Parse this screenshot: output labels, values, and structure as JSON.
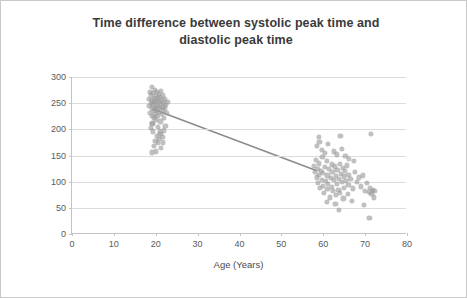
{
  "chart_data": {
    "type": "scatter",
    "title": "Time difference between systolic peak time and diastolic peak time",
    "title_line1": "Time difference between systolic peak time and",
    "title_line2": "diastolic peak time",
    "xlabel": "Age (Years)",
    "ylabel": "DpTime - SpTime (ms)",
    "xlim": [
      0,
      80
    ],
    "ylim": [
      0,
      300
    ],
    "xticks": [
      0,
      10,
      20,
      30,
      40,
      50,
      60,
      70,
      80
    ],
    "yticks": [
      0,
      50,
      100,
      150,
      200,
      250,
      300
    ],
    "grid": "horizontal",
    "legend": "none",
    "marker_color": "#9a9a9a",
    "trendline_color": "#8c8c8c",
    "trendline": {
      "x1": 19.5,
      "y1": 238,
      "x2": 58.5,
      "y2": 120
    },
    "points": [
      [
        18.3,
        258
      ],
      [
        18.5,
        244
      ],
      [
        18.6,
        272
      ],
      [
        18.7,
        232
      ],
      [
        18.8,
        251
      ],
      [
        18.9,
        266
      ],
      [
        19.0,
        240
      ],
      [
        19.0,
        225
      ],
      [
        19.1,
        281
      ],
      [
        19.2,
        257
      ],
      [
        19.2,
        212
      ],
      [
        19.3,
        248
      ],
      [
        19.4,
        270
      ],
      [
        19.5,
        236
      ],
      [
        19.5,
        260
      ],
      [
        19.6,
        222
      ],
      [
        19.7,
        253
      ],
      [
        19.8,
        276
      ],
      [
        19.8,
        241
      ],
      [
        19.9,
        230
      ],
      [
        20.0,
        264
      ],
      [
        20.0,
        247
      ],
      [
        20.1,
        219
      ],
      [
        20.2,
        255
      ],
      [
        20.3,
        271
      ],
      [
        20.3,
        238
      ],
      [
        20.4,
        226
      ],
      [
        20.5,
        259
      ],
      [
        20.6,
        245
      ],
      [
        20.6,
        205
      ],
      [
        20.7,
        268
      ],
      [
        20.8,
        233
      ],
      [
        20.9,
        252
      ],
      [
        21.0,
        262
      ],
      [
        21.0,
        241
      ],
      [
        21.1,
        215
      ],
      [
        21.2,
        249
      ],
      [
        21.3,
        274
      ],
      [
        21.4,
        229
      ],
      [
        21.5,
        256
      ],
      [
        21.6,
        243
      ],
      [
        21.7,
        265
      ],
      [
        21.8,
        236
      ],
      [
        21.9,
        250
      ],
      [
        22.0,
        222
      ],
      [
        22.1,
        258
      ],
      [
        22.2,
        240
      ],
      [
        22.4,
        246
      ],
      [
        22.6,
        231
      ],
      [
        22.8,
        253
      ],
      [
        19.4,
        196
      ],
      [
        20.2,
        188
      ],
      [
        21.1,
        192
      ],
      [
        20.7,
        182
      ],
      [
        19.9,
        178
      ],
      [
        21.6,
        186
      ],
      [
        20.5,
        174
      ],
      [
        19.6,
        168
      ],
      [
        21.3,
        164
      ],
      [
        20.9,
        196
      ],
      [
        18.9,
        203
      ],
      [
        22.0,
        198
      ],
      [
        19.2,
        210
      ],
      [
        22.3,
        207
      ],
      [
        20.1,
        158
      ],
      [
        21.8,
        175
      ],
      [
        19.1,
        156
      ],
      [
        57.8,
        130
      ],
      [
        58.0,
        118
      ],
      [
        58.2,
        142
      ],
      [
        58.4,
        108
      ],
      [
        58.6,
        125
      ],
      [
        58.8,
        97
      ],
      [
        59.0,
        135
      ],
      [
        59.0,
        113
      ],
      [
        59.2,
        88
      ],
      [
        59.4,
        121
      ],
      [
        59.6,
        104
      ],
      [
        59.8,
        147
      ],
      [
        60.0,
        92
      ],
      [
        60.0,
        116
      ],
      [
        60.2,
        78
      ],
      [
        60.4,
        128
      ],
      [
        60.6,
        101
      ],
      [
        60.8,
        139
      ],
      [
        61.0,
        86
      ],
      [
        61.0,
        112
      ],
      [
        61.2,
        95
      ],
      [
        61.4,
        124
      ],
      [
        61.6,
        70
      ],
      [
        61.8,
        107
      ],
      [
        62.0,
        133
      ],
      [
        62.0,
        90
      ],
      [
        62.2,
        119
      ],
      [
        62.4,
        82
      ],
      [
        62.6,
        103
      ],
      [
        62.8,
        129
      ],
      [
        63.0,
        74
      ],
      [
        63.0,
        111
      ],
      [
        63.2,
        96
      ],
      [
        63.4,
        122
      ],
      [
        63.6,
        85
      ],
      [
        63.8,
        106
      ],
      [
        64.0,
        134
      ],
      [
        64.0,
        79
      ],
      [
        64.2,
        115
      ],
      [
        64.4,
        99
      ],
      [
        64.6,
        126
      ],
      [
        64.8,
        68
      ],
      [
        65.0,
        110
      ],
      [
        65.0,
        88
      ],
      [
        65.2,
        120
      ],
      [
        65.4,
        102
      ],
      [
        65.6,
        131
      ],
      [
        65.8,
        76
      ],
      [
        66.0,
        113
      ],
      [
        66.0,
        94
      ],
      [
        66.5,
        105
      ],
      [
        67.0,
        87
      ],
      [
        67.5,
        118
      ],
      [
        68.0,
        99
      ],
      [
        68.5,
        108
      ],
      [
        69.0,
        91
      ],
      [
        69.5,
        112
      ],
      [
        70.0,
        83
      ],
      [
        70.5,
        97
      ],
      [
        71.0,
        80
      ],
      [
        71.2,
        88
      ],
      [
        71.5,
        76
      ],
      [
        71.8,
        85
      ],
      [
        72.0,
        70
      ],
      [
        72.2,
        82
      ],
      [
        58.5,
        168
      ],
      [
        59.1,
        176
      ],
      [
        59.7,
        160
      ],
      [
        60.3,
        155
      ],
      [
        61.1,
        172
      ],
      [
        62.5,
        158
      ],
      [
        63.3,
        152
      ],
      [
        64.1,
        187
      ],
      [
        64.5,
        162
      ],
      [
        65.3,
        149
      ],
      [
        66.2,
        144
      ],
      [
        67.3,
        140
      ],
      [
        58.9,
        185
      ],
      [
        63.7,
        46
      ],
      [
        71.0,
        30
      ],
      [
        71.4,
        192
      ],
      [
        69.8,
        56
      ],
      [
        60.9,
        62
      ],
      [
        62.9,
        58
      ],
      [
        66.8,
        64
      ]
    ]
  }
}
